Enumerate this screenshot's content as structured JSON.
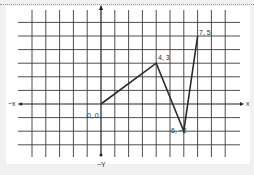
{
  "chart_data": {
    "type": "line",
    "title": "",
    "xlabel": "X",
    "ylabel": "Y",
    "axis_labels": {
      "pos_x": "X",
      "neg_x": "-X",
      "neg_y": "-Y"
    },
    "grid": true,
    "xlim": [
      -6,
      9
    ],
    "ylim": [
      -3,
      6
    ],
    "points": [
      {
        "x": 0,
        "y": 0,
        "label": "0, 0"
      },
      {
        "x": 4,
        "y": 3,
        "label": "4, 3"
      },
      {
        "x": 6,
        "y": -2,
        "label": "6, -2"
      },
      {
        "x": 7,
        "y": 5,
        "label": "7, 5"
      }
    ]
  },
  "labels": {
    "p0": "0, 0",
    "p1": "4, 3",
    "p2": "6, −2",
    "p3": "7, 5",
    "x_pos": "x",
    "x_neg": "−x",
    "y_neg": "−Y"
  },
  "colors": {
    "line": "#2a2a2a",
    "grid": "#3a3a3a",
    "background": "#ffffff"
  }
}
